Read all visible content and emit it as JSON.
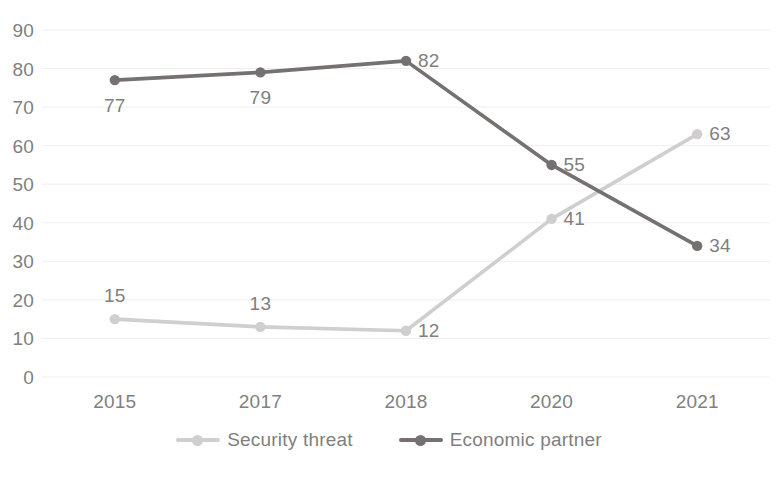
{
  "chart_data": {
    "type": "line",
    "title": "",
    "subtitle": "",
    "xlabel": "",
    "ylabel": "",
    "categories": [
      "2015",
      "2017",
      "2018",
      "2020",
      "2021"
    ],
    "ylim": [
      0,
      90
    ],
    "ytick_labels": [
      "90",
      "80",
      "70",
      "60",
      "50",
      "40",
      "30",
      "20",
      "10",
      "0"
    ],
    "ytick_values": [
      90,
      80,
      70,
      60,
      50,
      40,
      30,
      20,
      10,
      0
    ],
    "grid": true,
    "grid_axis": "y",
    "legend_position": "bottom",
    "series": [
      {
        "name": "Security threat",
        "color": "#d0cece",
        "values": [
          15,
          13,
          12,
          41,
          63
        ],
        "data_labels": [
          "15",
          "13",
          "12",
          "41",
          "63"
        ],
        "label_positions": [
          "above",
          "above",
          "right",
          "right",
          "right"
        ]
      },
      {
        "name": "Economic partner",
        "color": "#767171",
        "values": [
          77,
          79,
          82,
          55,
          34
        ],
        "data_labels": [
          "77",
          "79",
          "82",
          "55",
          "34"
        ],
        "label_positions": [
          "below",
          "below",
          "right",
          "right",
          "right"
        ]
      }
    ]
  },
  "legend": {
    "items": [
      {
        "label": "Security threat",
        "color": "#d0cece"
      },
      {
        "label": "Economic partner",
        "color": "#767171"
      }
    ]
  },
  "colors": {
    "axis_text": "#7f7f7f",
    "gridline": "#f0eeee",
    "background": "#ffffff",
    "series_light": "#d0cece",
    "series_dark": "#767171"
  }
}
